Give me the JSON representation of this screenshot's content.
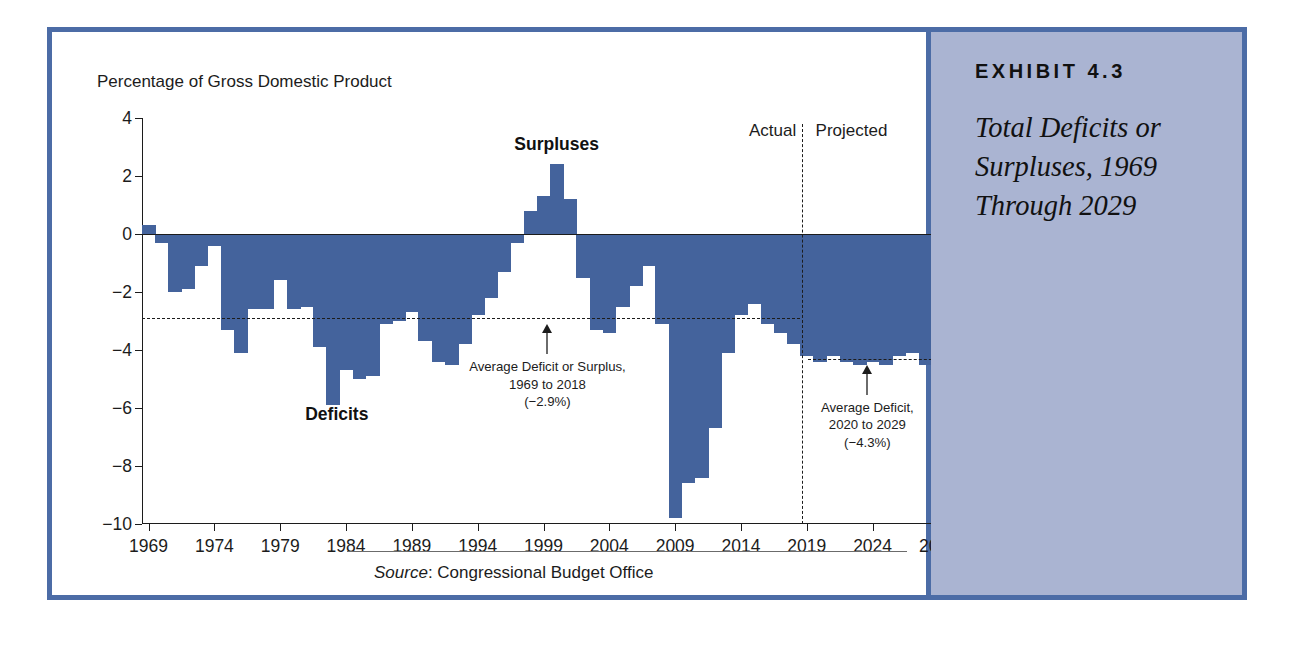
{
  "exhibit": {
    "kicker": "EXHIBIT 4.3",
    "title_lines": [
      "Total Deficits or",
      "Surpluses, 1969",
      "Through 2029"
    ]
  },
  "source": {
    "label": "Source",
    "separator": ": ",
    "text": "Congressional Budget Office"
  },
  "colors": {
    "bar": "#44639c",
    "frame": "#4c6ca6",
    "sidebar": "#aab4d2",
    "ink": "#1c1c1c"
  },
  "chart_data": {
    "type": "bar",
    "title": "",
    "subtitle": "",
    "ylabel": "Percentage of Gross Domestic Product",
    "xlabel": "",
    "ylim": [
      -10,
      4
    ],
    "xlim": [
      1968.5,
      2029.5
    ],
    "grid": false,
    "legend": "none",
    "ytick_labels": [
      "4",
      "2",
      "0",
      "−2",
      "−4",
      "−6",
      "−8",
      "−10"
    ],
    "ytick_values": [
      4,
      2,
      0,
      -2,
      -4,
      -6,
      -8,
      -10
    ],
    "xtick_labels": [
      "1969",
      "1974",
      "1979",
      "1984",
      "1989",
      "1994",
      "1999",
      "2004",
      "2009",
      "2014",
      "2019",
      "2024",
      "2029"
    ],
    "xtick_values": [
      1969,
      1974,
      1979,
      1984,
      1989,
      1994,
      1999,
      2004,
      2009,
      2014,
      2019,
      2024,
      2029
    ],
    "series_name": "Total Deficit or Surplus",
    "x": [
      1969,
      1970,
      1971,
      1972,
      1973,
      1974,
      1975,
      1976,
      1977,
      1978,
      1979,
      1980,
      1981,
      1982,
      1983,
      1984,
      1985,
      1986,
      1987,
      1988,
      1989,
      1990,
      1991,
      1992,
      1993,
      1994,
      1995,
      1996,
      1997,
      1998,
      1999,
      2000,
      2001,
      2002,
      2003,
      2004,
      2005,
      2006,
      2007,
      2008,
      2009,
      2010,
      2011,
      2012,
      2013,
      2014,
      2015,
      2016,
      2017,
      2018,
      2019,
      2020,
      2021,
      2022,
      2023,
      2024,
      2025,
      2026,
      2027,
      2028,
      2029
    ],
    "values": [
      0.3,
      -0.3,
      -2.0,
      -1.9,
      -1.1,
      -0.4,
      -3.3,
      -4.1,
      -2.6,
      -2.6,
      -1.6,
      -2.6,
      -2.5,
      -3.9,
      -5.9,
      -4.7,
      -5.0,
      -4.9,
      -3.1,
      -3.0,
      -2.7,
      -3.7,
      -4.4,
      -4.5,
      -3.8,
      -2.8,
      -2.2,
      -1.3,
      -0.3,
      0.8,
      1.3,
      2.4,
      1.2,
      -1.5,
      -3.3,
      -3.4,
      -2.5,
      -1.8,
      -1.1,
      -3.1,
      -9.8,
      -8.6,
      -8.4,
      -6.7,
      -4.1,
      -2.8,
      -2.4,
      -3.1,
      -3.4,
      -3.8,
      -4.2,
      -4.4,
      -4.2,
      -4.4,
      -4.5,
      -4.4,
      -4.5,
      -4.2,
      -4.1,
      -4.5,
      -4.6
    ],
    "annotations": [
      {
        "name": "average-1969-2018",
        "lines": [
          "Average Deficit or Surplus,",
          "1969 to 2018",
          "(−2.9%)"
        ],
        "value": -2.9,
        "x_at": 1999.3,
        "line_from": 1969,
        "line_to": 2018
      },
      {
        "name": "average-2020-2029",
        "lines": [
          "Average Deficit,",
          "2020 to 2029",
          "(−4.3%)"
        ],
        "value": -4.3,
        "x_at": 2023.6,
        "line_from": 2019.6,
        "line_to": 2029.5
      }
    ],
    "callouts": [
      {
        "name": "surpluses-label",
        "text": "Surpluses",
        "x_at": 2000,
        "y_at": 3.1
      },
      {
        "name": "deficits-label",
        "text": "Deficits",
        "x_at": 1983.3,
        "y_at": -6.2
      }
    ],
    "eras": [
      {
        "name": "actual",
        "label": "Actual",
        "x_at": 2016.4,
        "y_at": 3.55
      },
      {
        "name": "projected",
        "label": "Projected",
        "x_at": 2022.4,
        "y_at": 3.55
      }
    ],
    "divider": {
      "name": "actual-projected-divider",
      "x_at": 2018.6,
      "y_top": 3.8,
      "y_bottom": -10
    }
  }
}
